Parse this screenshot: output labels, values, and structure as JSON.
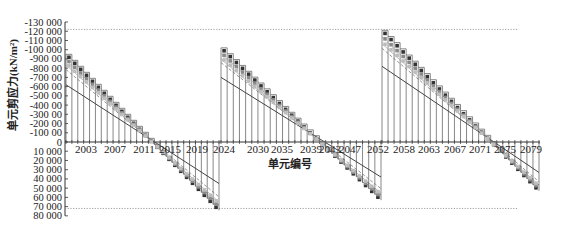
{
  "chart_data": {
    "type": "line",
    "title": "",
    "xlabel": "单元编号",
    "ylabel": "单元剪应力(kN/m²)",
    "ylim": [
      80000,
      -130000
    ],
    "y_inverted": true,
    "y_ticks": [
      {
        "value": -130000,
        "label": "-130 000"
      },
      {
        "value": -120000,
        "label": "-120 000"
      },
      {
        "value": -110000,
        "label": "-110 000"
      },
      {
        "value": -100000,
        "label": "-100 000"
      },
      {
        "value": -90000,
        "label": "-900 00"
      },
      {
        "value": -80000,
        "label": "-800 00"
      },
      {
        "value": -70000,
        "label": "-700 00"
      },
      {
        "value": -60000,
        "label": "-600 00"
      },
      {
        "value": -50000,
        "label": "-500 00"
      },
      {
        "value": -40000,
        "label": "-400 00"
      },
      {
        "value": -30000,
        "label": "-300 00"
      },
      {
        "value": -20000,
        "label": "-200 00"
      },
      {
        "value": -10000,
        "label": "-100 00"
      },
      {
        "value": 0,
        "label": "0"
      },
      {
        "value": 10000,
        "label": "10 000"
      },
      {
        "value": 20000,
        "label": "20 000"
      },
      {
        "value": 30000,
        "label": "30 000"
      },
      {
        "value": 40000,
        "label": "40 000"
      },
      {
        "value": 50000,
        "label": "50 000"
      },
      {
        "value": 60000,
        "label": "60 000"
      },
      {
        "value": 70000,
        "label": "70 000"
      },
      {
        "value": 80000,
        "label": "80 000"
      }
    ],
    "x_ticks": [
      "2003",
      "2007",
      "2011",
      "2015",
      "2019",
      "2024",
      "2030",
      "2035",
      "2039",
      "2043",
      "2047",
      "2052",
      "2058",
      "2063",
      "2067",
      "2071",
      "2075",
      "2079"
    ],
    "reference_lines": [
      {
        "value": -122000,
        "style": "dotted"
      },
      {
        "value": 72000,
        "style": "dotted"
      }
    ],
    "segments": [
      {
        "x_start": "2000",
        "x_end": "2026",
        "outer_start": -95000,
        "outer_end": 74000,
        "inner_start": -62000,
        "inner_end": 45000
      },
      {
        "x_start": "2027",
        "x_end": "2053",
        "outer_start": -102000,
        "outer_end": 63000,
        "inner_start": -70000,
        "inner_end": 38000
      },
      {
        "x_start": "2054",
        "x_end": "2080",
        "outer_start": -121000,
        "outer_end": 53000,
        "inner_start": -82000,
        "inner_end": 33000
      }
    ],
    "series": [
      {
        "name": "envelope-max",
        "style": "dark squares",
        "color": "#333333"
      },
      {
        "name": "intermediate-1",
        "style": "grey squares",
        "color": "#8a8a8a"
      },
      {
        "name": "intermediate-2",
        "style": "light squares",
        "color": "#bdbdbd"
      },
      {
        "name": "dashed",
        "style": "dashed line",
        "color": "#777777"
      },
      {
        "name": "envelope-min",
        "style": "solid line",
        "color": "#444444"
      }
    ],
    "grid": false,
    "legend": "none"
  }
}
